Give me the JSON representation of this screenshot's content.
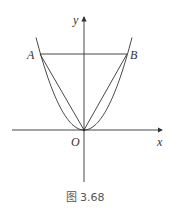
{
  "figure": {
    "caption": "图 3.68",
    "labels": {
      "y_axis": "y",
      "x_axis": "x",
      "origin": "O",
      "point_a": "A",
      "point_b": "B"
    },
    "elements": [
      "parabola through A, O, B",
      "segment AB",
      "segment AO",
      "segment BO",
      "x-axis",
      "y-axis"
    ],
    "stroke_color": "#333333"
  }
}
